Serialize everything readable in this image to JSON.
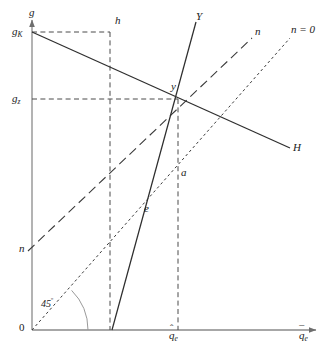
{
  "figure": {
    "title": "",
    "background_color": "#ffffff",
    "line_color": "#3a3a3a",
    "axis_color": "#808080",
    "text_color": "#1a1a1a",
    "width": 336,
    "height": 352
  },
  "axes": {
    "y_axis_label": "g",
    "x_axis_label_base": "q",
    "x_axis_label_sub": "e",
    "x_axis_label_accent": "¯",
    "origin_label": "0",
    "y_ticks": [
      {
        "id": "gK",
        "base": "g",
        "sub": "K",
        "value_y": 32
      },
      {
        "id": "gz",
        "base": "g",
        "sub": "z",
        "value_y": 99
      }
    ],
    "x_ticks": [
      {
        "id": "qe_hat",
        "base": "q",
        "sub": "e",
        "accent": "ˆ",
        "value_x": 178
      }
    ]
  },
  "angle_annotation": {
    "text": "45",
    "degree_symbol": "º",
    "x": 41,
    "y": 298
  },
  "curves": [
    {
      "id": "H",
      "label": "H",
      "style": "solid",
      "from": [
        32,
        32
      ],
      "to": [
        290,
        148
      ],
      "label_pos": [
        293,
        142
      ]
    },
    {
      "id": "Y",
      "label": "Y",
      "style": "solid",
      "from": [
        112,
        330
      ],
      "to": [
        196,
        22
      ],
      "label_pos": [
        196,
        11
      ]
    },
    {
      "id": "n",
      "label": "n",
      "style": "long-dash",
      "from": [
        28,
        251
      ],
      "to": [
        252,
        38
      ],
      "label_pos": [
        255,
        26
      ],
      "start_label": "n",
      "start_label_pos": [
        19,
        243
      ]
    },
    {
      "id": "n0",
      "label": "n = 0",
      "style": "dotted",
      "from": [
        32,
        330
      ],
      "to": [
        290,
        38
      ],
      "label_pos": [
        291,
        24
      ]
    }
  ],
  "guide_lines": [
    {
      "id": "h-vertical",
      "style": "dashed",
      "from": [
        110,
        32
      ],
      "to": [
        110,
        330
      ]
    },
    {
      "id": "gK-horizontal",
      "style": "dashed",
      "from": [
        32,
        32
      ],
      "to": [
        110,
        32
      ]
    },
    {
      "id": "gz-horizontal",
      "style": "dashed",
      "from": [
        32,
        99
      ],
      "to": [
        178,
        99
      ]
    },
    {
      "id": "qe-vertical",
      "style": "dashed",
      "from": [
        178,
        99
      ],
      "to": [
        178,
        330
      ]
    }
  ],
  "points": [
    {
      "id": "h",
      "label": "h",
      "x": 110,
      "y": 32,
      "label_pos": [
        115,
        15
      ]
    },
    {
      "id": "y",
      "label": "y",
      "x": 178,
      "y": 99,
      "label_pos": [
        172,
        81
      ]
    },
    {
      "id": "a",
      "label": "a",
      "x": 178,
      "y": 175,
      "label_pos": [
        181,
        168
      ]
    },
    {
      "id": "e",
      "label": "e",
      "x": 146,
      "y": 211,
      "label_pos": [
        145,
        204
      ]
    }
  ]
}
